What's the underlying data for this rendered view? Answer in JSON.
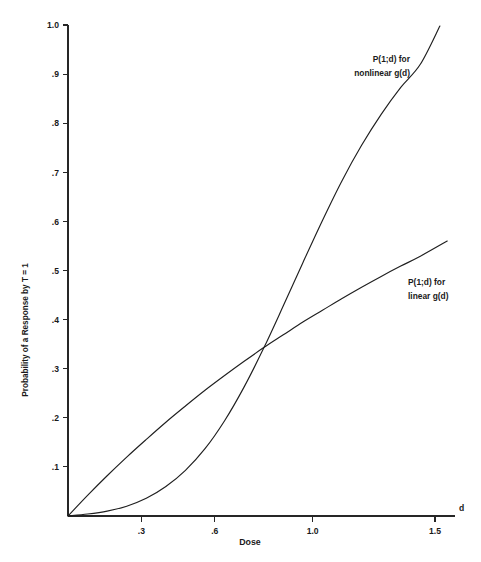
{
  "chart_data": {
    "type": "line",
    "title": "",
    "xlabel": "Dose",
    "ylabel": "Probability of a Response by T = 1",
    "axis_symbol_x": "d",
    "xlim": [
      0.0,
      1.62
    ],
    "ylim": [
      0.0,
      1.0
    ],
    "grid": false,
    "legend_position": "inline-annotations",
    "xticks": [
      0.3,
      0.6,
      1.0,
      1.5
    ],
    "xtick_labels": [
      ".3",
      ".6",
      "1.0",
      "1.5"
    ],
    "yticks": [
      0.1,
      0.2,
      0.3,
      0.4,
      0.5,
      0.6,
      0.7,
      0.8,
      0.9,
      1.0
    ],
    "ytick_labels": [
      ".1",
      ".2",
      ".3",
      ".4",
      ".5",
      ".6",
      ".7",
      ".8",
      ".9",
      "1.0"
    ],
    "series": [
      {
        "name": "P(1;d) for nonlinear g(d)",
        "annotation_line1": "P(1;d) for",
        "annotation_line2": "nonlinear g(d)",
        "style": "sigmoid-convex-then-concave",
        "x": [
          0.0,
          0.08,
          0.16,
          0.24,
          0.32,
          0.4,
          0.48,
          0.56,
          0.64,
          0.72,
          0.8,
          0.88,
          0.96,
          1.04,
          1.12,
          1.2,
          1.28,
          1.36,
          1.44,
          1.52
        ],
        "y": [
          0.0,
          0.004,
          0.01,
          0.02,
          0.036,
          0.06,
          0.093,
          0.137,
          0.194,
          0.263,
          0.342,
          0.428,
          0.516,
          0.602,
          0.683,
          0.755,
          0.818,
          0.873,
          0.92,
          0.998
        ]
      },
      {
        "name": "P(1;d) for linear g(d)",
        "annotation_line1": "P(1;d) for",
        "annotation_line2": "linear g(d)",
        "style": "concave-near-linear",
        "x": [
          0.0,
          0.08,
          0.16,
          0.24,
          0.32,
          0.4,
          0.48,
          0.56,
          0.64,
          0.72,
          0.8,
          0.88,
          0.96,
          1.04,
          1.12,
          1.2,
          1.28,
          1.36,
          1.44,
          1.55
        ],
        "y": [
          0.0,
          0.042,
          0.082,
          0.12,
          0.156,
          0.191,
          0.224,
          0.256,
          0.286,
          0.315,
          0.343,
          0.369,
          0.395,
          0.419,
          0.443,
          0.466,
          0.488,
          0.509,
          0.529,
          0.56
        ]
      }
    ],
    "annotations": [
      {
        "id": "nonlinear-annotation",
        "line1": "P(1;d) for",
        "line2": "nonlinear g(d)",
        "anchor_x": 1.245,
        "anchor_y": 0.925,
        "align": "end"
      },
      {
        "id": "linear-annotation",
        "line1": "P(1;d) for",
        "line2": "linear g(d)",
        "anchor_x": 1.435,
        "anchor_y": 0.465,
        "align": "start"
      }
    ],
    "crossing_point": {
      "x": 0.66,
      "y": 0.285
    }
  }
}
